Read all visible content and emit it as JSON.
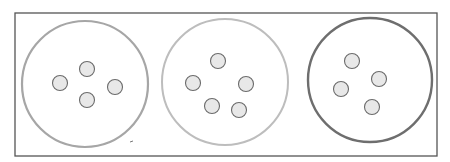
{
  "diagram": {
    "frame": {
      "x": 15,
      "y": 13,
      "width": 422,
      "height": 143,
      "stroke": "#555555",
      "stroke_width": 1.3
    },
    "groups": [
      {
        "id": "group-1",
        "dot_count": 4,
        "circle": {
          "cx": 85,
          "cy": 84,
          "r": 63,
          "stroke": "#a6a6a6",
          "stroke_width": 2.2
        },
        "dots": [
          {
            "cx": 60,
            "cy": 83
          },
          {
            "cx": 87,
            "cy": 69
          },
          {
            "cx": 115,
            "cy": 87
          },
          {
            "cx": 87,
            "cy": 100
          }
        ]
      },
      {
        "id": "group-2",
        "dot_count": 5,
        "circle": {
          "cx": 225,
          "cy": 82,
          "r": 63,
          "stroke": "#bdbdbd",
          "stroke_width": 2.0
        },
        "dots": [
          {
            "cx": 218,
            "cy": 61
          },
          {
            "cx": 193,
            "cy": 83
          },
          {
            "cx": 246,
            "cy": 84
          },
          {
            "cx": 212,
            "cy": 106
          },
          {
            "cx": 239,
            "cy": 110
          }
        ]
      },
      {
        "id": "group-3",
        "dot_count": 4,
        "circle": {
          "cx": 370,
          "cy": 80,
          "r": 62,
          "stroke": "#6e6e6e",
          "stroke_width": 2.4
        },
        "dots": [
          {
            "cx": 352,
            "cy": 61
          },
          {
            "cx": 379,
            "cy": 79
          },
          {
            "cx": 341,
            "cy": 89
          },
          {
            "cx": 372,
            "cy": 107
          }
        ]
      }
    ],
    "dot_style": {
      "r": 7.5,
      "fill": "#e8e8e8",
      "stroke": "#6a6a6a",
      "stroke_width": 1.1
    },
    "stray_mark": {
      "x1": 130,
      "y1": 142,
      "x2": 133,
      "y2": 141,
      "stroke": "#777777"
    }
  }
}
